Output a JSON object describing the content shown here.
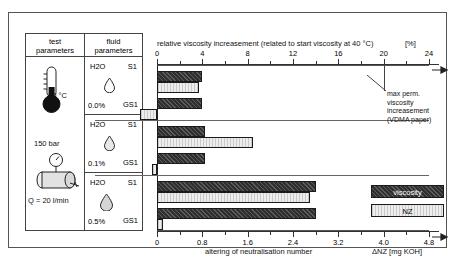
{
  "table": {
    "headers": [
      {
        "line1": "test",
        "line2": "parameters"
      },
      {
        "line1": "fluid",
        "line2": "parameters"
      }
    ],
    "test_parameters": {
      "temperature": "60 °C",
      "pressure": "150 bar",
      "flow": "Q = 20 l/min",
      "thermometer_icon": "thermometer-icon",
      "cylinder_icon": "hydraulic-cylinder-icon"
    },
    "fluid_groups": [
      {
        "fluid": "H2O",
        "water_content": "0.0%",
        "rows": [
          "S1",
          "GS1"
        ],
        "droplet_icon": "water-droplet-icon"
      },
      {
        "fluid": "H2O",
        "water_content": "0.1%",
        "rows": [
          "S1",
          "GS1"
        ],
        "droplet_icon": "water-droplet-icon"
      },
      {
        "fluid": "H2O",
        "water_content": "0.5%",
        "rows": [
          "S1",
          "GS1"
        ],
        "droplet_icon": "water-droplet-icon"
      }
    ]
  },
  "annotation": {
    "line1": "max perm.",
    "line2": "viscosity",
    "line3": "increasement",
    "line4": "(VDMA paper)",
    "value": 20
  },
  "legend": {
    "viscosity_label": "viscosity",
    "nz_label": "NZ"
  },
  "colors": {
    "viscosity": "#2f2f2f",
    "nz": "#ededed",
    "axis": "#333333",
    "border": "#555555"
  },
  "chart_data": {
    "type": "bar",
    "orientation": "horizontal",
    "title": "relative viscosity increasement  (related to start viscosity at 40 °C)",
    "xlabel_top": "relative viscosity increasement  (related to start viscosity at 40 °C)",
    "xunit_top": "[%]",
    "xlabel_bottom": "altering of neutralisation number",
    "xunit_bottom": "ΔNZ [mg KOH]",
    "xlim_top": [
      0,
      24
    ],
    "xticks_top": [
      0,
      4,
      8,
      12,
      16,
      20,
      24
    ],
    "xlim_bottom": [
      0,
      4.8
    ],
    "xticks_bottom": [
      "0",
      "0.8",
      "1.6",
      "2.4",
      "3.2",
      "4.0",
      "4.8"
    ],
    "grid": false,
    "legend_position": "bottom-right",
    "categories": [
      "S1 (0.0%)",
      "GS1 (0.0%)",
      "S1 (0.1%)",
      "GS1 (0.1%)",
      "S1 (0.5%)",
      "GS1 (0.5%)"
    ],
    "series": [
      {
        "name": "viscosity",
        "unit": "%",
        "values": [
          4.0,
          4.0,
          4.2,
          4.2,
          14.0,
          14.0
        ]
      },
      {
        "name": "NZ",
        "unit": "mg KOH",
        "values": [
          0.74,
          -0.3,
          1.7,
          -0.08,
          2.7,
          0.1
        ]
      }
    ],
    "groups": [
      {
        "water_content": "0.0%",
        "bars": [
          {
            "row": "S1",
            "viscosity": 4.0,
            "nz": 0.74
          },
          {
            "row": "GS1",
            "viscosity": 4.0,
            "nz": -0.3
          }
        ]
      },
      {
        "water_content": "0.1%",
        "bars": [
          {
            "row": "S1",
            "viscosity": 4.2,
            "nz": 1.7
          },
          {
            "row": "GS1",
            "viscosity": 4.2,
            "nz": -0.08
          }
        ]
      },
      {
        "water_content": "0.5%",
        "bars": [
          {
            "row": "S1",
            "viscosity": 14.0,
            "nz": 2.7
          },
          {
            "row": "GS1",
            "viscosity": 14.0,
            "nz": 0.1
          }
        ]
      }
    ],
    "reference_line": {
      "label": "max perm. viscosity increasement (VDMA paper)",
      "value": 20
    }
  }
}
